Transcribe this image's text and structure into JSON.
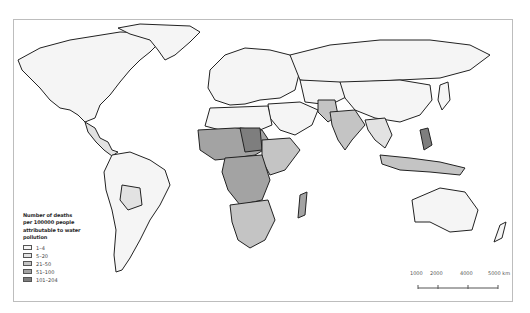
{
  "map": {
    "type": "choropleth",
    "subject": "world map",
    "legend": {
      "title": "Number of deaths per 100000 people attributable to water pollution",
      "title_lines": [
        "Number of deaths",
        "per 100000 people",
        "attributable to water",
        "pollution"
      ],
      "items": [
        {
          "label": "1–4",
          "color": "#f5f5f5"
        },
        {
          "label": "5–20",
          "color": "#e2e2e2"
        },
        {
          "label": "21–50",
          "color": "#c4c4c4"
        },
        {
          "label": "51–100",
          "color": "#a3a3a3"
        },
        {
          "label": "101–204",
          "color": "#7e7e7e"
        }
      ]
    },
    "scale_bar": {
      "labels": [
        "1000",
        "2000",
        "4000",
        "5000 km"
      ],
      "unit": "km"
    },
    "colors": {
      "border": "#222222",
      "ocean": "#ffffff",
      "frame": "#bdbdbd"
    }
  }
}
